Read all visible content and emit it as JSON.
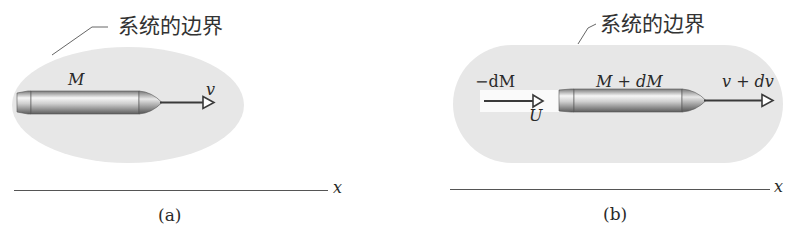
{
  "figure": {
    "panels": [
      {
        "id": "a",
        "caption": "(a)",
        "boundary_label": "系统的边界",
        "mass_label": "M",
        "velocity_label": "v",
        "axis_label": "x"
      },
      {
        "id": "b",
        "caption": "(b)",
        "boundary_label": "系统的边界",
        "ejected_mass_label": "−dM",
        "ejected_velocity_label": "U",
        "mass_label": "M + dM",
        "velocity_label": "v + dv",
        "axis_label": "x"
      }
    ],
    "colors": {
      "boundary_fill": "#e6e6e6",
      "rocket_dark": "#6e6e6e",
      "rocket_light": "#f4f4f4",
      "arrow": "#3a3a3a",
      "axis": "#555555"
    }
  }
}
